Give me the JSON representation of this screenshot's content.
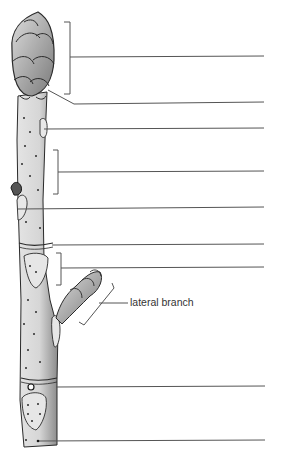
{
  "diagram": {
    "labels": [
      {
        "id": "label-1",
        "text": "",
        "y": 57
      },
      {
        "id": "label-2",
        "text": "",
        "y": 103
      },
      {
        "id": "label-3",
        "text": "",
        "y": 128
      },
      {
        "id": "label-4",
        "text": "",
        "y": 171
      },
      {
        "id": "label-5",
        "text": "",
        "y": 208
      },
      {
        "id": "label-6",
        "text": "",
        "y": 245
      },
      {
        "id": "label-7",
        "text": "",
        "y": 268
      },
      {
        "id": "label-lateral",
        "text": "lateral branch",
        "y": 297
      },
      {
        "id": "label-8",
        "text": "",
        "y": 386
      },
      {
        "id": "label-9",
        "text": "",
        "y": 440
      }
    ],
    "colors": {
      "line": "#555555",
      "stem_fill": "#dcdcdc",
      "ink": "#2a2a2a",
      "background": "#ffffff"
    }
  }
}
